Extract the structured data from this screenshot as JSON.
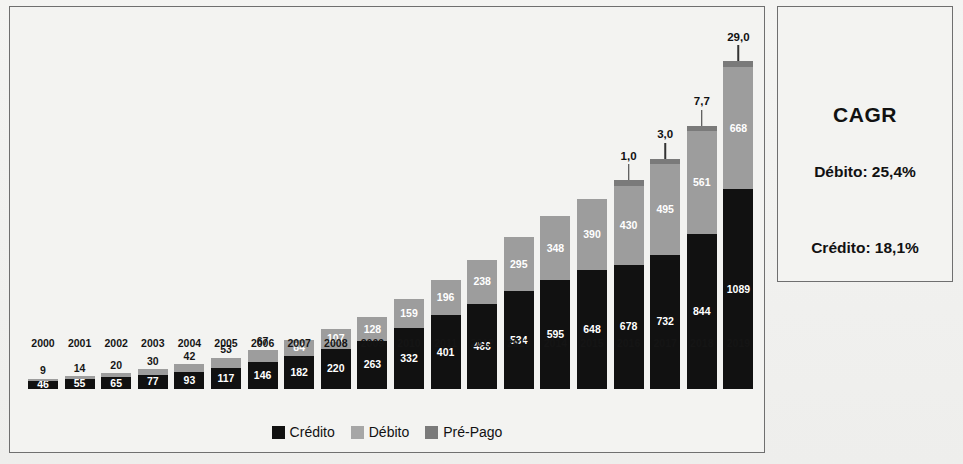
{
  "chart_data": {
    "type": "bar",
    "stacked": true,
    "title": "",
    "xlabel": "",
    "ylabel": "",
    "grid": false,
    "legend_position": "bottom",
    "categories": [
      "2000",
      "2001",
      "2002",
      "2003",
      "2004",
      "2005",
      "2006",
      "2007",
      "2008",
      "2009",
      "2010",
      "2011",
      "2012",
      "2013",
      "2014",
      "2015",
      "2016",
      "2017",
      "2018",
      "2019"
    ],
    "series": [
      {
        "name": "Crédito",
        "color": "#111111",
        "values": [
          46,
          55,
          65,
          77,
          93,
          117,
          146,
          182,
          220,
          263,
          332,
          401,
          466,
          534,
          595,
          648,
          678,
          732,
          844,
          1089
        ],
        "labels": [
          "46",
          "55",
          "65",
          "77",
          "93",
          "117",
          "146",
          "182",
          "220",
          "263",
          "332",
          "401",
          "466",
          "534",
          "595",
          "648",
          "678",
          "732",
          "844",
          "1089"
        ]
      },
      {
        "name": "Débito",
        "color": "#9d9d9d",
        "values": [
          9,
          14,
          20,
          30,
          42,
          53,
          67,
          84,
          107,
          128,
          159,
          196,
          238,
          295,
          348,
          390,
          430,
          495,
          561,
          668
        ],
        "labels": [
          "9",
          "14",
          "20",
          "30",
          "42",
          "53",
          "67",
          "84",
          "107",
          "128",
          "159",
          "196",
          "238",
          "295",
          "348",
          "390",
          "430",
          "495",
          "561",
          "668"
        ]
      },
      {
        "name": "Pré-Pago",
        "color": "#7a7a7a",
        "values": [
          0,
          0,
          0,
          0,
          0,
          0,
          0,
          0,
          0,
          0,
          0,
          0,
          0,
          0,
          0,
          0,
          1.0,
          3.0,
          7.7,
          29.0
        ],
        "labels": [
          "",
          "",
          "",
          "",
          "",
          "",
          "",
          "",
          "",
          "",
          "",
          "",
          "",
          "",
          "",
          "",
          "1,0",
          "3,0",
          "7,7",
          "29,0"
        ]
      }
    ],
    "ylim": [
      0,
      1800
    ],
    "axis_visible": false
  },
  "legend": {
    "items": [
      {
        "label": "Crédito",
        "swatch": "credito-swatch"
      },
      {
        "label": "Débito",
        "swatch": "debito-swatch"
      },
      {
        "label": "Pré-Pago",
        "swatch": "prepago-swatch"
      }
    ]
  },
  "cagr": {
    "title": "CAGR",
    "debito": "Débito: 25,4%",
    "credito": "Crédito: 18,1%"
  },
  "colors": {
    "credito": "#111111",
    "debito": "#9d9d9d",
    "prepago": "#7a7a7a",
    "panel_border": "#6f6f6f",
    "background": "#f3f3f1"
  }
}
